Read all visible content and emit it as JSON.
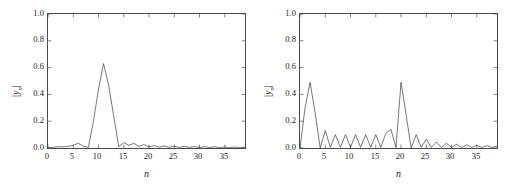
{
  "figure": {
    "background": "#ffffff",
    "line_color": "#3c3c3c",
    "axis_color": "#4a4a4a"
  },
  "panels": [
    {
      "id": "left",
      "ylabel_bar_left": "|",
      "ylabel_y": "y",
      "ylabel_sub": "n",
      "ylabel_bar_right": "|",
      "xlabel": "n",
      "yticks": [
        "0.0",
        "0.2",
        "0.4",
        "0.6",
        "0.8",
        "1.0"
      ],
      "xticks": [
        "0",
        "5",
        "10",
        "15",
        "20",
        "25",
        "30",
        "35"
      ]
    },
    {
      "id": "right",
      "ylabel_bar_left": "|",
      "ylabel_y": "y",
      "ylabel_sub": "n",
      "ylabel_bar_right": "|",
      "xlabel": "n",
      "yticks": [
        "0.0",
        "0.2",
        "0.4",
        "0.6",
        "0.8",
        "1.0"
      ],
      "xticks": [
        "0",
        "5",
        "10",
        "15",
        "20",
        "25",
        "30",
        "35"
      ]
    }
  ],
  "chart_data": [
    {
      "type": "line",
      "id": "left-plot",
      "title": "",
      "xlabel": "n",
      "ylabel": "|y_n|",
      "xlim": [
        0,
        39
      ],
      "ylim": [
        0.0,
        1.0
      ],
      "xticks": [
        0,
        5,
        10,
        15,
        20,
        25,
        30,
        35
      ],
      "yticks": [
        0.0,
        0.2,
        0.4,
        0.6,
        0.8,
        1.0
      ],
      "grid": false,
      "legend": "none",
      "x": [
        0,
        1,
        2,
        3,
        4,
        5,
        6,
        7,
        8,
        9,
        10,
        11,
        12,
        13,
        14,
        15,
        16,
        17,
        18,
        19,
        20,
        21,
        22,
        23,
        24,
        25,
        26,
        27,
        28,
        29,
        30,
        31,
        32,
        33,
        34,
        35,
        36,
        37,
        38,
        39
      ],
      "values": [
        0.0,
        0.005,
        0.01,
        0.008,
        0.012,
        0.02,
        0.035,
        0.012,
        0.005,
        0.2,
        0.44,
        0.63,
        0.47,
        0.24,
        0.01,
        0.04,
        0.02,
        0.035,
        0.012,
        0.025,
        0.008,
        0.018,
        0.006,
        0.016,
        0.005,
        0.014,
        0.004,
        0.012,
        0.004,
        0.011,
        0.003,
        0.01,
        0.003,
        0.009,
        0.003,
        0.008,
        0.002,
        0.007,
        0.002,
        0.006
      ]
    },
    {
      "type": "line",
      "id": "right-plot",
      "title": "",
      "xlabel": "n",
      "ylabel": "|y_n|",
      "xlim": [
        0,
        39
      ],
      "ylim": [
        0.0,
        1.0
      ],
      "xticks": [
        0,
        5,
        10,
        15,
        20,
        25,
        30,
        35
      ],
      "yticks": [
        0.0,
        0.2,
        0.4,
        0.6,
        0.8,
        1.0
      ],
      "grid": false,
      "legend": "none",
      "x": [
        0,
        1,
        2,
        3,
        4,
        5,
        6,
        7,
        8,
        9,
        10,
        11,
        12,
        13,
        14,
        15,
        16,
        17,
        18,
        19,
        20,
        21,
        22,
        23,
        24,
        25,
        26,
        27,
        28,
        29,
        30,
        31,
        32,
        33,
        34,
        35,
        36,
        37,
        38,
        39
      ],
      "values": [
        0.0,
        0.3,
        0.49,
        0.26,
        0.0,
        0.13,
        0.005,
        0.1,
        0.005,
        0.1,
        0.005,
        0.1,
        0.005,
        0.1,
        0.005,
        0.1,
        0.005,
        0.11,
        0.14,
        0.003,
        0.49,
        0.25,
        0.0,
        0.1,
        0.005,
        0.065,
        0.004,
        0.045,
        0.004,
        0.035,
        0.004,
        0.028,
        0.004,
        0.024,
        0.004,
        0.02,
        0.004,
        0.018,
        0.004,
        0.015
      ]
    }
  ]
}
